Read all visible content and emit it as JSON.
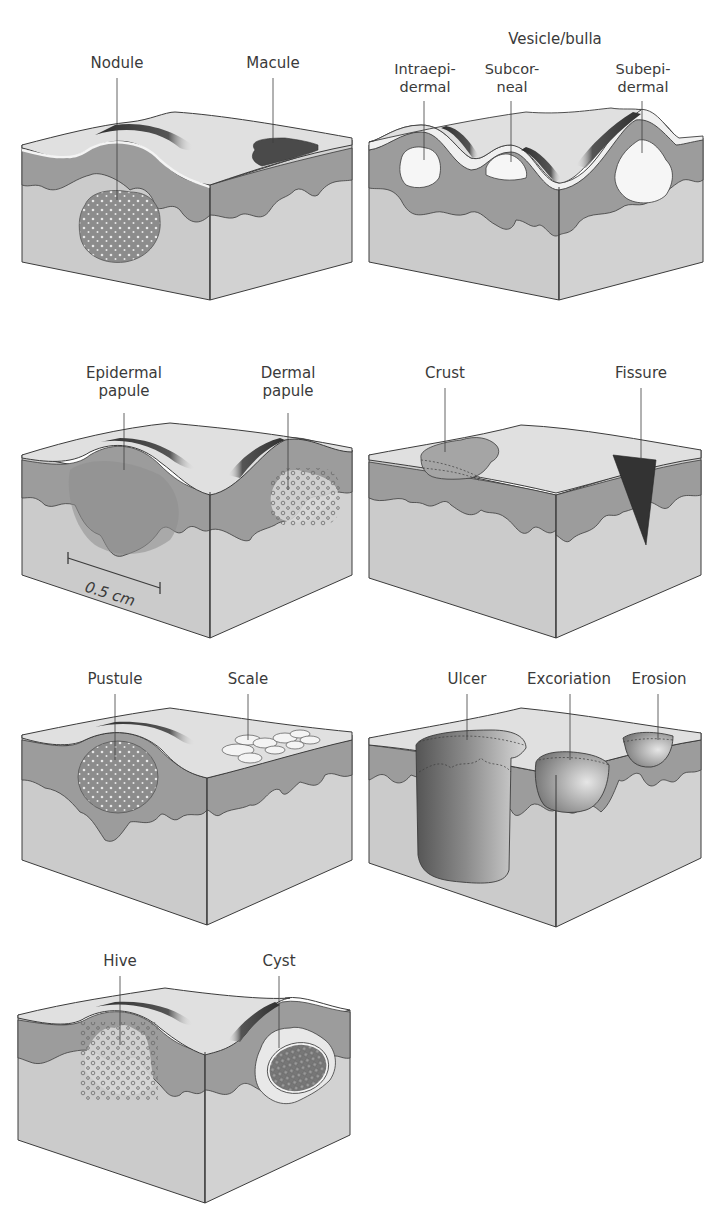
{
  "figure": {
    "colors": {
      "surface": "#dedede",
      "epidermis": "#9c9c9c",
      "dermis": "#cbcbcb",
      "outline": "#3c3c3c",
      "pigment": "#4a4a4a",
      "blister": "#f6f6f6"
    },
    "panels": [
      {
        "id": "nodule-macule",
        "labels": [
          "Nodule",
          "Macule"
        ]
      },
      {
        "id": "vesicle-bulla",
        "group_label": "Vesicle/bulla",
        "labels": [
          "Intraepi-\ndermal",
          "Subcor-\nneal",
          "Subepi-\ndermal"
        ]
      },
      {
        "id": "papules",
        "labels": [
          "Epidermal\npapule",
          "Dermal\npapule"
        ],
        "scale_bar": "0.5 cm"
      },
      {
        "id": "crust-fissure",
        "labels": [
          "Crust",
          "Fissure"
        ]
      },
      {
        "id": "pustule-scale",
        "labels": [
          "Pustule",
          "Scale"
        ]
      },
      {
        "id": "ulcer-excoriation-erosion",
        "labels": [
          "Ulcer",
          "Excoriation",
          "Erosion"
        ]
      },
      {
        "id": "hive-cyst",
        "labels": [
          "Hive",
          "Cyst"
        ]
      }
    ]
  }
}
